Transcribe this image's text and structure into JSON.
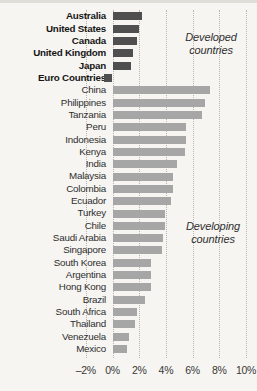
{
  "colors": {
    "background": "#f6f5f1",
    "developed_bar": "#4f4f4f",
    "developing_bar": "#a6a6a6",
    "gridline": "#b7b5ae",
    "label_text": "#2e2e2e",
    "tick_text": "#383838"
  },
  "annotations": {
    "developed": "Developed\ncountries",
    "developing": "Developing\ncountries"
  },
  "chart_data": {
    "type": "bar",
    "orientation": "horizontal",
    "title": "",
    "xlabel": "",
    "ylabel": "",
    "unit": "%",
    "xlim": [
      -2,
      10
    ],
    "x_ticks": [
      -2,
      0,
      2,
      4,
      6,
      8,
      10
    ],
    "x_tick_labels": [
      "–2%",
      "0%",
      "2%",
      "4%",
      "6%",
      "8%",
      "10%"
    ],
    "grid": "vertical-dotted",
    "legend": "none",
    "groups": [
      {
        "name": "Developed countries",
        "bar_color": "#4f4f4f",
        "label_style": "bold",
        "rows": [
          {
            "label": "Australia",
            "value": 2.2
          },
          {
            "label": "United States",
            "value": 2.0
          },
          {
            "label": "Canada",
            "value": 1.8
          },
          {
            "label": "United Kingdom",
            "value": 1.5
          },
          {
            "label": "Japan",
            "value": 1.4
          },
          {
            "label": "Euro Countries",
            "value": -0.6
          }
        ]
      },
      {
        "name": "Developing countries",
        "bar_color": "#a6a6a6",
        "label_style": "regular",
        "rows": [
          {
            "label": "China",
            "value": 7.3
          },
          {
            "label": "Philippines",
            "value": 6.9
          },
          {
            "label": "Tanzania",
            "value": 6.7
          },
          {
            "label": "Peru",
            "value": 5.5
          },
          {
            "label": "Indonesia",
            "value": 5.5
          },
          {
            "label": "Kenya",
            "value": 5.4
          },
          {
            "label": "India",
            "value": 4.8
          },
          {
            "label": "Malaysia",
            "value": 4.5
          },
          {
            "label": "Colombia",
            "value": 4.5
          },
          {
            "label": "Ecuador",
            "value": 4.4
          },
          {
            "label": "Turkey",
            "value": 3.9
          },
          {
            "label": "Chile",
            "value": 3.9
          },
          {
            "label": "Saudi Arabia",
            "value": 3.8
          },
          {
            "label": "Singapore",
            "value": 3.7
          },
          {
            "label": "South Korea",
            "value": 2.9
          },
          {
            "label": "Argentina",
            "value": 2.9
          },
          {
            "label": "Hong Kong",
            "value": 2.9
          },
          {
            "label": "Brazil",
            "value": 2.4
          },
          {
            "label": "South Africa",
            "value": 1.8
          },
          {
            "label": "Thailand",
            "value": 1.7
          },
          {
            "label": "Venezuela",
            "value": 1.2
          },
          {
            "label": "Mexico",
            "value": 1.1
          }
        ]
      }
    ]
  }
}
